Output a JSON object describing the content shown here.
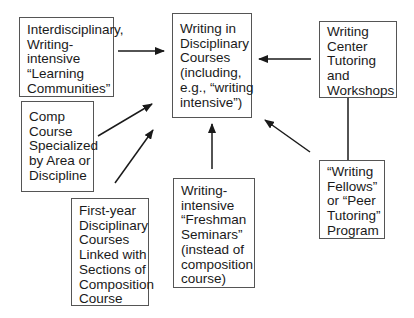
{
  "diagram": {
    "nodes": {
      "center": {
        "lines": [
          "Writing in",
          "Disciplinary",
          "Courses",
          "(including,",
          "e.g., “writing",
          "intensive”)"
        ]
      },
      "learning_communities": {
        "lines": [
          "Interdisciplinary,",
          "Writing-",
          "intensive",
          "“Learning",
          "Communities”"
        ]
      },
      "comp_course": {
        "lines": [
          "Comp",
          "Course",
          "Specialized",
          "by Area or",
          "Discipline"
        ]
      },
      "first_year": {
        "lines": [
          "First-year",
          "Disciplinary",
          "Courses",
          "Linked with",
          "Sections of",
          "Composition",
          "Course"
        ]
      },
      "freshman_seminars": {
        "lines": [
          "Writing-",
          "intensive",
          "“Freshman",
          "Seminars”",
          "(instead of",
          "composition",
          "course)"
        ]
      },
      "writing_center": {
        "lines": [
          "Writing",
          "Center",
          "Tutoring",
          "and",
          "Workshops"
        ]
      },
      "writing_fellows": {
        "lines": [
          "“Writing",
          "Fellows”",
          "or “Peer",
          "Tutoring”",
          "Program"
        ]
      }
    },
    "edges": [
      {
        "from": "learning_communities",
        "to": "center"
      },
      {
        "from": "comp_course",
        "to": "center"
      },
      {
        "from": "first_year",
        "to": "center"
      },
      {
        "from": "freshman_seminars",
        "to": "center"
      },
      {
        "from": "writing_center",
        "to": "center"
      },
      {
        "from": "writing_fellows",
        "to": "center"
      },
      {
        "from": "writing_center",
        "to": "writing_fellows",
        "arrow": false
      }
    ],
    "colors": {
      "border": "#555555",
      "arrow": "#1a1a1a",
      "text": "#1a1a1a"
    }
  }
}
